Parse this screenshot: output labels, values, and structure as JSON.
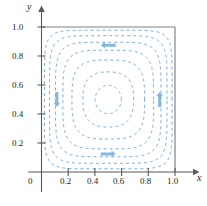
{
  "figure": {
    "kind": "contour-plot-with-flow-arrows",
    "background": "#ffffff"
  },
  "axes": {
    "x_name": "x",
    "y_name": "y",
    "origin_label": "0",
    "x_ticks": [
      "0.2",
      "0.4",
      "0.6",
      "0.8",
      "1.0"
    ],
    "y_ticks": [
      "0.2",
      "0.4",
      "0.6",
      "0.8",
      "1.0"
    ],
    "axis_color": "#58595b",
    "tick_color": "#58595b",
    "label_color": "#231f20"
  },
  "chart_data": {
    "type": "line",
    "title": "",
    "xlabel": "x",
    "ylabel": "y",
    "xlim": [
      0,
      1.05
    ],
    "ylim": [
      0,
      1.05
    ],
    "xticks": [
      0.2,
      0.4,
      0.6,
      0.8,
      1.0
    ],
    "yticks": [
      0.2,
      0.4,
      0.6,
      0.8,
      1.0
    ],
    "grid": false,
    "legend": "none",
    "style": {
      "contour_color": "#5b9bd5",
      "contour_dash": "3 3",
      "contour_width": 0.9,
      "arrow_color": "#7eb3de",
      "boundary_color": "#808285"
    },
    "boundary_lines": [
      {
        "name": "top-boundary-y-equals-1",
        "from": [
          0,
          1.0
        ],
        "to": [
          1.0,
          1.0
        ]
      },
      {
        "name": "right-boundary-x-equals-1",
        "from": [
          1.0,
          1.0
        ],
        "to": [
          1.0,
          0
        ]
      }
    ],
    "contours": [
      {
        "level": 1,
        "kind": "rounded-square",
        "half_width": 0.478,
        "corner_exponent": 7.0
      },
      {
        "level": 2,
        "kind": "rounded-square",
        "half_width": 0.44,
        "corner_exponent": 6.0
      },
      {
        "level": 3,
        "kind": "rounded-square",
        "half_width": 0.395,
        "corner_exponent": 5.0
      },
      {
        "level": 4,
        "kind": "rounded-square",
        "half_width": 0.34,
        "corner_exponent": 4.2
      },
      {
        "level": 5,
        "kind": "rounded-square",
        "half_width": 0.272,
        "corner_exponent": 3.4
      },
      {
        "level": 6,
        "kind": "rounded-square",
        "half_width": 0.19,
        "corner_exponent": 2.6
      },
      {
        "level": 7,
        "kind": "circle",
        "half_width": 0.098,
        "corner_exponent": 2.0
      }
    ],
    "arrows": [
      {
        "name": "top-arrow",
        "x": 0.5,
        "y": 0.875,
        "direction": "left"
      },
      {
        "name": "bottom-arrow",
        "x": 0.5,
        "y": 0.125,
        "direction": "right"
      },
      {
        "name": "left-arrow",
        "x": 0.115,
        "y": 0.5,
        "direction": "down"
      },
      {
        "name": "right-arrow",
        "x": 0.885,
        "y": 0.5,
        "direction": "up"
      }
    ]
  }
}
